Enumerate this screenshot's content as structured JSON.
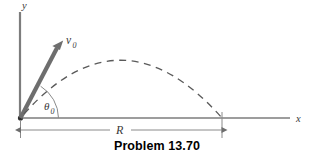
{
  "figure": {
    "caption": "Problem 13.70",
    "axis_labels": {
      "y": "y",
      "x": "x"
    },
    "vector_label": {
      "symbol": "v",
      "subscript": "0"
    },
    "angle_label": {
      "symbol": "θ",
      "subscript": "0"
    },
    "range_label": "R",
    "colors": {
      "axis": "#7d7d7d",
      "vector": "#6e6e6e",
      "trajectory": "#5a5a5a",
      "dimension": "#8a8a8a",
      "label": "#3a3a3a",
      "caption": "#000000",
      "background": "#ffffff"
    },
    "geometry": {
      "origin": [
        20,
        118
      ],
      "y_axis_top": [
        20,
        12
      ],
      "x_axis_right": [
        290,
        118
      ],
      "vector_tip": [
        62,
        42
      ],
      "apex": [
        125,
        59
      ],
      "landing": [
        222,
        118
      ],
      "dimension_y": 130
    }
  }
}
